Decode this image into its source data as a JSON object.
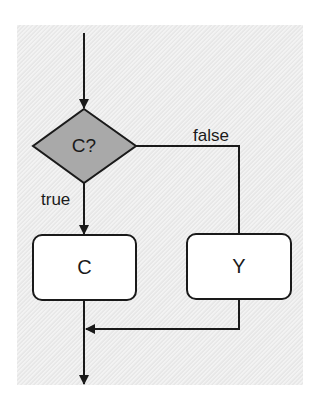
{
  "diagram": {
    "type": "flowchart",
    "background_color": "#ececec",
    "decision": {
      "id": "decision-c",
      "label": "C?",
      "shape": "diamond",
      "fill": "#a9a9a9"
    },
    "processes": [
      {
        "id": "box-c",
        "label": "C",
        "fill": "#ffffff"
      },
      {
        "id": "box-y",
        "label": "Y",
        "fill": "#ffffff"
      }
    ],
    "edges": [
      {
        "from": "entry",
        "to": "decision-c",
        "label": ""
      },
      {
        "from": "decision-c",
        "to": "box-c",
        "label": "true"
      },
      {
        "from": "decision-c",
        "to": "box-y",
        "label": "false"
      },
      {
        "from": "box-y",
        "to": "merge",
        "label": ""
      },
      {
        "from": "box-c",
        "to": "exit",
        "label": ""
      }
    ],
    "labels": {
      "true_label": "true",
      "false_label": "false"
    }
  }
}
